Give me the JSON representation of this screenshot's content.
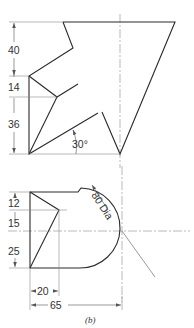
{
  "figure": {
    "caption": "(b)",
    "upper_view": {
      "dimensions": {
        "d40": "40",
        "d14": "14",
        "d36": "36",
        "angle": "30°"
      }
    },
    "lower_view": {
      "dimensions": {
        "d12": "12",
        "d15": "15",
        "d25": "25",
        "d20": "20",
        "d65": "65",
        "diameter": "80 Dia"
      }
    }
  },
  "colors": {
    "line": "#2a2a2a",
    "construction": "#8a8a8a",
    "background": "#ffffff"
  }
}
